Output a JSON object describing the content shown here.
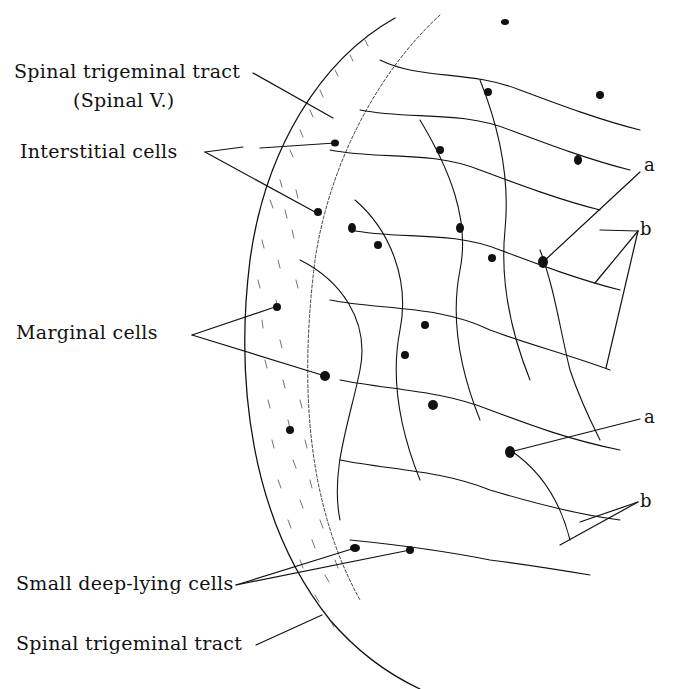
{
  "figure": {
    "type": "histological drawing"
  },
  "labels": {
    "spinal_trigeminal_tract_top": "Spinal trigeminal tract",
    "spinal_v": "(Spinal V.)",
    "interstitial_cells": "Interstitial cells",
    "marginal_cells": "Marginal cells",
    "small_deep_lying_cells": "Small deep-lying cells",
    "spinal_trigeminal_tract_bottom": "Spinal trigeminal tract",
    "a_upper": "a",
    "b_upper": "b",
    "a_lower": "a",
    "b_lower": "b"
  },
  "colors": {
    "ink": "#111111",
    "paper": "#ffffff"
  }
}
